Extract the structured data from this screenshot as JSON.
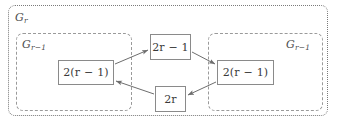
{
  "figure": {
    "groups": [
      {
        "id": "outer",
        "label": "G",
        "sub": "r",
        "name": "group-gr"
      },
      {
        "id": "inner-left",
        "label": "G",
        "sub": "r−1",
        "name": "group-gr-minus-1-left"
      },
      {
        "id": "inner-right",
        "label": "G",
        "sub": "r−1",
        "name": "group-gr-minus-1-right"
      }
    ],
    "nodes": {
      "top": {
        "text": "2r − 1",
        "prefix": "2",
        "var": "r",
        "suffix": " − 1"
      },
      "left": {
        "text": "2(r − 1)",
        "prefix": "2(",
        "var": "r",
        "suffix": " − 1)"
      },
      "right": {
        "text": "2(r − 1)",
        "prefix": "2(",
        "var": "r",
        "suffix": " − 1)"
      },
      "bottom": {
        "text": "2r",
        "prefix": "2",
        "var": "r",
        "suffix": ""
      }
    },
    "edges": [
      {
        "from": "left",
        "to": "top",
        "name": "edge-left-to-top"
      },
      {
        "from": "top",
        "to": "right",
        "name": "edge-top-to-right"
      },
      {
        "from": "right",
        "to": "bottom",
        "name": "edge-right-to-bottom"
      },
      {
        "from": "bottom",
        "to": "left",
        "name": "edge-bottom-to-left"
      }
    ],
    "colors": {
      "outer_border": "#7a7a7a",
      "inner_border": "#9a9a9a",
      "node_border": "#8a8a8a",
      "edge": "#6e6e6e",
      "text": "#3a3a3a",
      "background": "#ffffff"
    }
  }
}
